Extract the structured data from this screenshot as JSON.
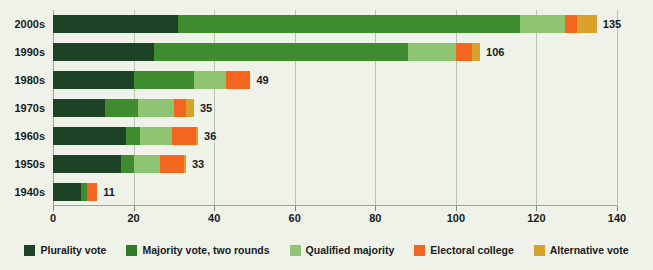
{
  "chart_data": {
    "type": "bar",
    "orientation": "horizontal",
    "stacked": true,
    "title": "",
    "xlabel": "",
    "ylabel": "",
    "xlim": [
      0,
      140
    ],
    "xticks": [
      0,
      20,
      40,
      60,
      80,
      100,
      120,
      140
    ],
    "grid": true,
    "legend_position": "bottom",
    "categories": [
      "2000s",
      "1990s",
      "1980s",
      "1970s",
      "1960s",
      "1950s",
      "1940s"
    ],
    "series": [
      {
        "name": "Plurality vote",
        "color": "#1d4326",
        "values": [
          31,
          25,
          20,
          13,
          18,
          17,
          7
        ]
      },
      {
        "name": "Majority vote, two rounds",
        "color": "#3f8c2e",
        "values": [
          85,
          63,
          15,
          8,
          3.5,
          3,
          1.5
        ]
      },
      {
        "name": "Qualified majority",
        "color": "#8fc472",
        "values": [
          11,
          12,
          8,
          9,
          8,
          6.5,
          0
        ]
      },
      {
        "name": "Electoral college",
        "color": "#f4661f",
        "values": [
          3,
          4,
          6,
          3,
          6,
          6,
          2.5
        ]
      },
      {
        "name": "Alternative vote",
        "color": "#d9a22c",
        "values": [
          5,
          2,
          0,
          2,
          0.5,
          0.5,
          0
        ]
      }
    ],
    "totals": [
      135,
      106,
      49,
      35,
      36,
      33,
      11
    ],
    "total_labels": [
      "135",
      "106",
      "49",
      "35",
      "36",
      "33",
      "11"
    ]
  },
  "axis": {
    "tick_labels": [
      "0",
      "20",
      "40",
      "60",
      "80",
      "100",
      "120",
      "140"
    ]
  },
  "legend": {
    "items": [
      {
        "label": "Plurality vote",
        "color": "#1d4326"
      },
      {
        "label": "Majority vote, two rounds",
        "color": "#2d7a28"
      },
      {
        "label": "Qualified majority",
        "color": "#8fc472"
      },
      {
        "label": "Electoral college",
        "color": "#f4661f"
      },
      {
        "label": "Alternative vote",
        "color": "#d9a22c"
      }
    ]
  },
  "colors": {
    "background": "#eef2e9",
    "gridline": "#b9c6b4",
    "text": "#1a1a1a"
  }
}
